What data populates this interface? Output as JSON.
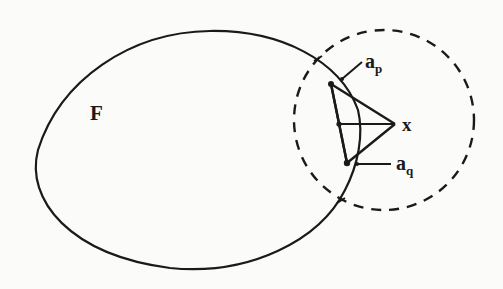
{
  "figure": {
    "type": "geometric diagram",
    "colors": {
      "ink": "#1a1a1a",
      "paper": "#fbfbf9"
    },
    "region": {
      "label": "F",
      "shape": "closed convex curve (egg-shaped)"
    },
    "neighborhood": {
      "shape": "dashed circle",
      "center_label": "x"
    },
    "points": {
      "x": {
        "label": "x"
      },
      "a_p": {
        "label": "a",
        "subscript": "p"
      },
      "a_q": {
        "label": "a",
        "subscript": "q"
      }
    },
    "elements": [
      "closed curve bounding region F",
      "dashed circle centered at x intersecting F",
      "triangle from two boundary-adjacent points to x",
      "segment from midpoint on left edge to x",
      "leader lines to labels a_p and a_q"
    ]
  }
}
